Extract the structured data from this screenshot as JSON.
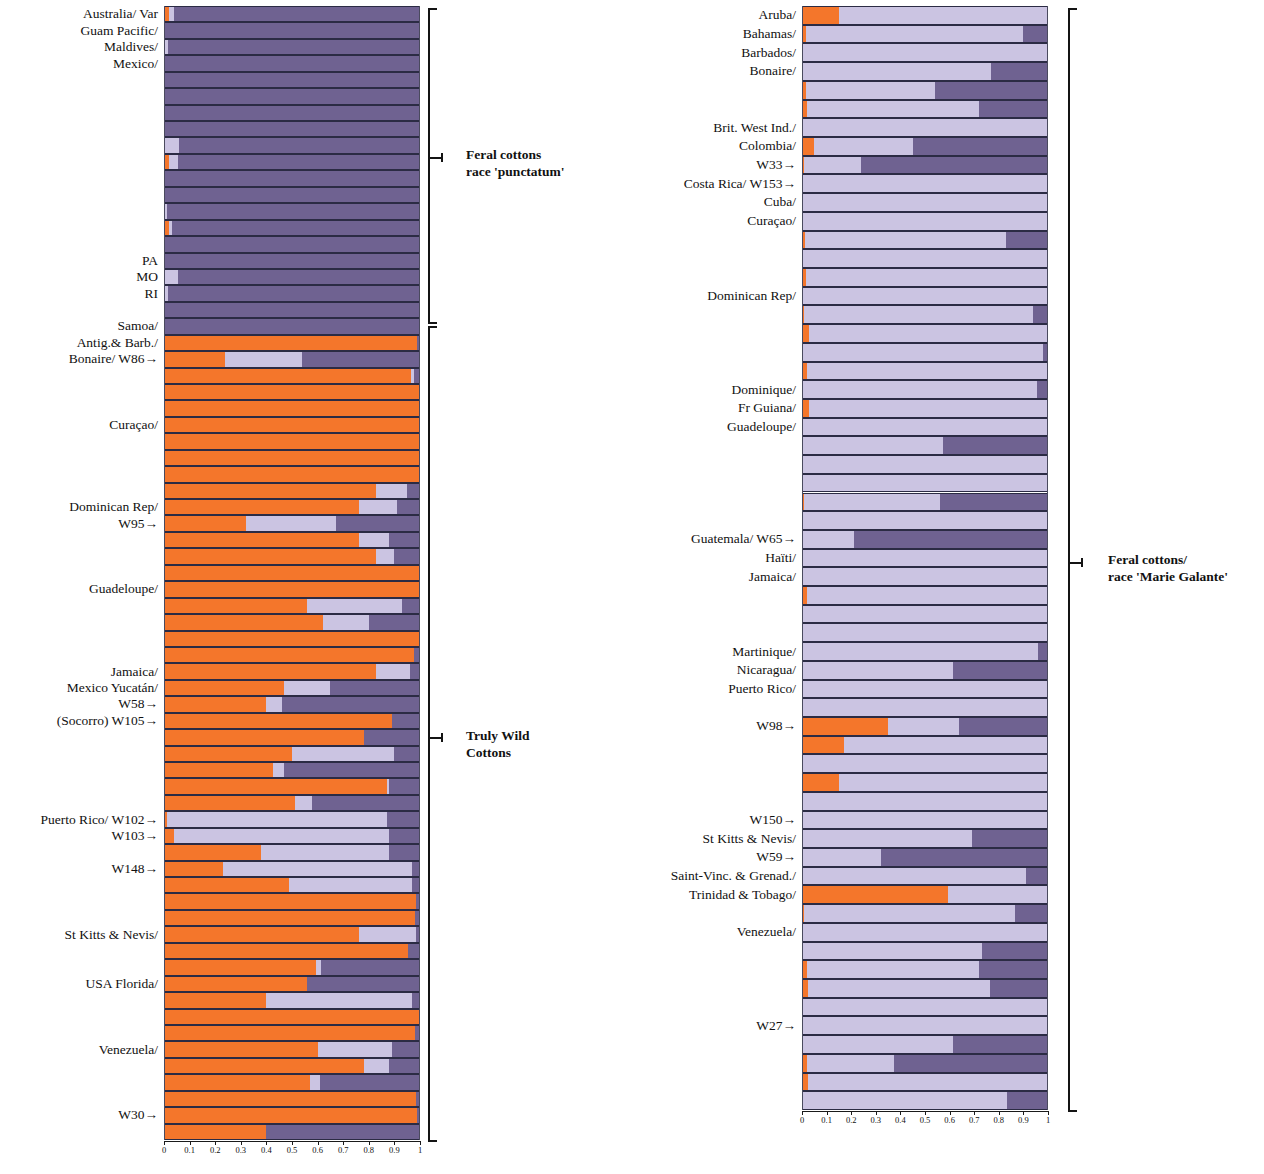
{
  "figure": {
    "type": "structure-admixture-barplot",
    "orientation": "horizontal",
    "panels": [
      "left",
      "right"
    ],
    "colors": {
      "cluster1": "#f4762b",
      "cluster2": "#cbc4e2",
      "cluster3": "#6f6291"
    }
  },
  "axis": {
    "ticks": [
      "0",
      "0.1",
      "0.2",
      "0.3",
      "0.4",
      "0.5",
      "0.6",
      "0.7",
      "0.8",
      "0.9",
      "1"
    ],
    "values": [
      0,
      0.1,
      0.2,
      0.3,
      0.4,
      0.5,
      0.6,
      0.7,
      0.8,
      0.9,
      1
    ],
    "min": 0,
    "max": 1
  },
  "annotations": [
    {
      "id": "feral-punctatum",
      "line1": "Feral cottons",
      "line2": "race 'punctatum'"
    },
    {
      "id": "truly-wild",
      "line1": "Truly Wild",
      "line2": "Cottons"
    },
    {
      "id": "feral-marie-galante",
      "line1": "Feral cottons/",
      "line2": "race 'Marie Galante'"
    }
  ],
  "chart_data": {
    "type": "bar",
    "subtype": "stacked-horizontal-admixture",
    "title": "",
    "xlabel": "",
    "ylabel": "",
    "xlim": [
      0,
      1
    ],
    "grid": false,
    "legend": "none",
    "series": [
      {
        "name": "cluster1",
        "color": "#f4762b"
      },
      {
        "name": "cluster2",
        "color": "#cbc4e2"
      },
      {
        "name": "cluster3",
        "color": "#6f6291"
      }
    ],
    "panels": [
      {
        "name": "left",
        "groups": [
          {
            "label": "Feral cottons race 'punctatum'",
            "start": 0,
            "end": 21
          },
          {
            "label": "Truly Wild Cottons",
            "start": 21,
            "end": 57
          }
        ],
        "labels": [
          {
            "row": 0,
            "text": "Australia/  Var"
          },
          {
            "row": 1,
            "text": "Guam Pacific/"
          },
          {
            "row": 2,
            "text": "Maldives/"
          },
          {
            "row": 3,
            "text": "Mexico/"
          },
          {
            "row": 15,
            "text": "PA"
          },
          {
            "row": 16,
            "text": "MO"
          },
          {
            "row": 17,
            "text": "RI"
          },
          {
            "row": 19,
            "text": "Samoa/"
          },
          {
            "row": 20,
            "text": "Antig.& Barb./"
          },
          {
            "row": 21,
            "text": "Bonaire/  W86→"
          },
          {
            "row": 25,
            "text": "Curaçao/"
          },
          {
            "row": 30,
            "text": "Dominican Rep/"
          },
          {
            "row": 31,
            "text": "W95→"
          },
          {
            "row": 35,
            "text": "Guadeloupe/"
          },
          {
            "row": 40,
            "text": "Jamaica/"
          },
          {
            "row": 41,
            "text": "Mexico Yucatán/"
          },
          {
            "row": 42,
            "text": "W58→"
          },
          {
            "row": 43,
            "text": "(Socorro) W105→"
          },
          {
            "row": 49,
            "text": "Puerto Rico/  W102→"
          },
          {
            "row": 50,
            "text": "W103→"
          },
          {
            "row": 52,
            "text": "W148→"
          },
          {
            "row": 56,
            "text": "St Kitts & Nevis/"
          },
          {
            "row": 59,
            "text": "USA Florida/"
          },
          {
            "row": 63,
            "text": "Venezuela/"
          },
          {
            "row": 67,
            "text": "W30→"
          }
        ],
        "rows": [
          [
            0.018,
            0.022,
            0.96
          ],
          [
            0.0,
            0.0,
            1.0
          ],
          [
            0.0,
            0.016,
            0.984
          ],
          [
            0.0,
            0.0,
            1.0
          ],
          [
            0.0,
            0.0,
            1.0
          ],
          [
            0.0,
            0.0,
            1.0
          ],
          [
            0.0,
            0.0,
            1.0
          ],
          [
            0.0,
            0.0,
            1.0
          ],
          [
            0.0,
            0.06,
            0.94
          ],
          [
            0.018,
            0.035,
            0.947
          ],
          [
            0.0,
            0.0,
            1.0
          ],
          [
            0.0,
            0.0,
            1.0
          ],
          [
            0.0,
            0.01,
            0.99
          ],
          [
            0.02,
            0.01,
            0.97
          ],
          [
            0.0,
            0.0,
            1.0
          ],
          [
            0.0,
            0.0,
            1.0
          ],
          [
            0.0,
            0.055,
            0.945
          ],
          [
            0.0,
            0.016,
            0.984
          ],
          [
            0.0,
            0.0,
            1.0
          ],
          [
            0.0,
            0.0,
            1.0
          ],
          [
            0.99,
            0.0,
            0.01
          ],
          [
            0.24,
            0.3,
            0.46
          ],
          [
            0.965,
            0.01,
            0.025
          ],
          [
            1.0,
            0.0,
            0.0
          ],
          [
            1.0,
            0.0,
            0.0
          ],
          [
            1.0,
            0.0,
            0.0
          ],
          [
            1.0,
            0.0,
            0.0
          ],
          [
            1.0,
            0.0,
            0.0
          ],
          [
            1.0,
            0.0,
            0.0
          ],
          [
            0.83,
            0.12,
            0.05
          ],
          [
            0.76,
            0.15,
            0.09
          ],
          [
            0.32,
            0.35,
            0.33
          ],
          [
            0.76,
            0.12,
            0.12
          ],
          [
            0.83,
            0.07,
            0.1
          ],
          [
            1.0,
            0.0,
            0.0
          ],
          [
            1.0,
            0.0,
            0.0
          ],
          [
            0.56,
            0.37,
            0.07
          ],
          [
            0.62,
            0.18,
            0.2
          ],
          [
            1.0,
            0.0,
            0.0
          ],
          [
            0.975,
            0.0,
            0.025
          ],
          [
            0.83,
            0.13,
            0.04
          ],
          [
            0.47,
            0.18,
            0.35
          ],
          [
            0.4,
            0.06,
            0.54
          ],
          [
            0.89,
            0.0,
            0.11
          ],
          [
            0.78,
            0.0,
            0.22
          ],
          [
            0.5,
            0.4,
            0.1
          ],
          [
            0.425,
            0.045,
            0.53
          ],
          [
            0.87,
            0.01,
            0.12
          ],
          [
            0.51,
            0.07,
            0.42
          ],
          [
            0.01,
            0.86,
            0.13
          ],
          [
            0.04,
            0.84,
            0.12
          ],
          [
            0.38,
            0.5,
            0.12
          ],
          [
            0.23,
            0.74,
            0.03
          ],
          [
            0.49,
            0.48,
            0.03
          ],
          [
            0.985,
            0.0,
            0.015
          ],
          [
            0.98,
            0.0,
            0.02
          ],
          [
            0.76,
            0.225,
            0.015
          ],
          [
            0.955,
            0.0,
            0.045
          ],
          [
            0.595,
            0.02,
            0.385
          ],
          [
            0.56,
            0.0,
            0.44
          ],
          [
            0.4,
            0.57,
            0.03
          ],
          [
            1.0,
            0.0,
            0.0
          ],
          [
            0.98,
            0.0,
            0.02
          ],
          [
            0.6,
            0.29,
            0.11
          ],
          [
            0.78,
            0.1,
            0.12
          ],
          [
            0.57,
            0.04,
            0.39
          ],
          [
            0.985,
            0.0,
            0.015
          ],
          [
            0.99,
            0.0,
            0.01
          ],
          [
            0.4,
            0.0,
            0.6
          ]
        ]
      },
      {
        "name": "right",
        "groups": [
          {
            "label": "Feral cottons/ race 'Marie Galante'",
            "start": 0,
            "end": 57
          }
        ],
        "labels": [
          {
            "row": 0,
            "text": "Aruba/"
          },
          {
            "row": 1,
            "text": "Bahamas/"
          },
          {
            "row": 2,
            "text": "Barbados/"
          },
          {
            "row": 3,
            "text": "Bonaire/"
          },
          {
            "row": 6,
            "text": "Brit. West Ind./"
          },
          {
            "row": 7,
            "text": "Colombia/"
          },
          {
            "row": 8,
            "text": "W33→"
          },
          {
            "row": 9,
            "text": "Costa Rica/  W153→"
          },
          {
            "row": 10,
            "text": "Cuba/"
          },
          {
            "row": 11,
            "text": "Curaçao/"
          },
          {
            "row": 15,
            "text": "Dominican Rep/"
          },
          {
            "row": 20,
            "text": "Dominique/"
          },
          {
            "row": 21,
            "text": "Fr Guiana/"
          },
          {
            "row": 22,
            "text": "Guadeloupe/"
          },
          {
            "row": 28,
            "text": "Guatemala/  W65→"
          },
          {
            "row": 29,
            "text": "Haïti/"
          },
          {
            "row": 30,
            "text": "Jamaica/"
          },
          {
            "row": 34,
            "text": "Martinique/"
          },
          {
            "row": 35,
            "text": "Nicaragua/"
          },
          {
            "row": 36,
            "text": "Puerto Rico/"
          },
          {
            "row": 38,
            "text": "W98→"
          },
          {
            "row": 43,
            "text": "W150→"
          },
          {
            "row": 44,
            "text": "St Kitts & Nevis/"
          },
          {
            "row": 45,
            "text": "W59→"
          },
          {
            "row": 46,
            "text": "Saint-Vinc. & Grenad./"
          },
          {
            "row": 47,
            "text": "Trinidad & Tobago/"
          },
          {
            "row": 49,
            "text": "Venezuela/"
          },
          {
            "row": 54,
            "text": "W27→"
          }
        ],
        "rows": [
          [
            0.15,
            0.85,
            0.0
          ],
          [
            0.015,
            0.885,
            0.1
          ],
          [
            0.0,
            1.0,
            0.0
          ],
          [
            0.0,
            0.77,
            0.23
          ],
          [
            0.015,
            0.525,
            0.46
          ],
          [
            0.02,
            0.7,
            0.28
          ],
          [
            0.0,
            1.0,
            0.0
          ],
          [
            0.05,
            0.4,
            0.55
          ],
          [
            0.01,
            0.23,
            0.76
          ],
          [
            0.0,
            1.0,
            0.0
          ],
          [
            0.0,
            1.0,
            0.0
          ],
          [
            0.0,
            1.0,
            0.0
          ],
          [
            0.012,
            0.818,
            0.17
          ],
          [
            0.0,
            1.0,
            0.0
          ],
          [
            0.018,
            0.982,
            0.0
          ],
          [
            0.0,
            1.0,
            0.0
          ],
          [
            0.01,
            0.93,
            0.06
          ],
          [
            0.03,
            0.97,
            0.0
          ],
          [
            0.0,
            0.98,
            0.02
          ],
          [
            0.02,
            0.98,
            0.0
          ],
          [
            0.0,
            0.955,
            0.045
          ],
          [
            0.03,
            0.97,
            0.0
          ],
          [
            0.0,
            1.0,
            0.0
          ],
          [
            0.0,
            0.575,
            0.425
          ],
          [
            0.0,
            1.0,
            0.0
          ],
          [
            0.0,
            1.0,
            0.0
          ],
          [
            0.008,
            0.552,
            0.44
          ],
          [
            0.0,
            1.0,
            0.0
          ],
          [
            0.0,
            0.21,
            0.79
          ],
          [
            0.0,
            1.0,
            0.0
          ],
          [
            0.0,
            1.0,
            0.0
          ],
          [
            0.02,
            1.0,
            0.0
          ],
          [
            0.0,
            1.0,
            0.0
          ],
          [
            0.0,
            1.0,
            0.0
          ],
          [
            0.0,
            0.96,
            0.04
          ],
          [
            0.005,
            0.61,
            0.385
          ],
          [
            0.0,
            1.0,
            0.0
          ],
          [
            0.0,
            1.0,
            0.0
          ],
          [
            0.35,
            0.29,
            0.36
          ],
          [
            0.17,
            0.83,
            0.0
          ],
          [
            0.0,
            1.0,
            0.0
          ],
          [
            0.15,
            0.85,
            0.0
          ],
          [
            0.0,
            1.0,
            0.0
          ],
          [
            0.0,
            1.0,
            0.0
          ],
          [
            0.0,
            0.69,
            0.31
          ],
          [
            0.0,
            0.32,
            0.68
          ],
          [
            0.005,
            0.905,
            0.09
          ],
          [
            0.595,
            0.405,
            0.0
          ],
          [
            0.01,
            0.855,
            0.135
          ],
          [
            0.0,
            1.0,
            0.0
          ],
          [
            0.0,
            0.73,
            0.27
          ],
          [
            0.02,
            0.7,
            0.28
          ],
          [
            0.025,
            0.74,
            0.235
          ],
          [
            0.0,
            1.0,
            0.0
          ],
          [
            0.0,
            1.0,
            0.0
          ],
          [
            0.0,
            0.615,
            0.385
          ],
          [
            0.02,
            0.355,
            0.625
          ],
          [
            0.025,
            0.975,
            0.0
          ],
          [
            0.0,
            0.835,
            0.165
          ]
        ]
      }
    ]
  }
}
